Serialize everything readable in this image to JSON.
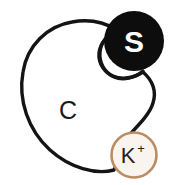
{
  "figure": {
    "background_color": "#ffffff",
    "width": 177,
    "height": 185
  },
  "body": {
    "label": "C",
    "fill_color": "#ffffff",
    "stroke_color": "#141414",
    "stroke_width": 3.4,
    "label_x": 68,
    "label_y": 119
  },
  "sphere_s": {
    "label": "S",
    "fill_color": "#0d0d0d",
    "text_color": "#ffffff",
    "cx": 134,
    "cy": 41,
    "r": 30,
    "label_x": 134,
    "label_y": 52
  },
  "ion_k": {
    "label": "K",
    "charge": "+",
    "fill_color": "#faf4ee",
    "ring_color": "#b5itemized",
    "ring_color_hex": "#b98c63",
    "text_color": "#2a2018",
    "cx": 134,
    "cy": 155,
    "r": 23,
    "ring_width": 2.6,
    "label_x": 128,
    "label_y": 163,
    "charge_x": 142,
    "charge_y": 152
  }
}
